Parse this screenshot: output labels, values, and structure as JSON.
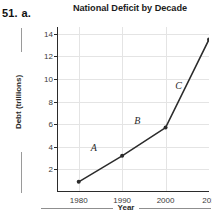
{
  "problem": {
    "number": "51.",
    "part": "a."
  },
  "chart_data": {
    "type": "line",
    "title": "National Deficit by Decade",
    "xlabel": "Year",
    "ylabel": "Debt (trillions)",
    "x": [
      1980,
      1990,
      2000,
      2010
    ],
    "values": [
      0.9,
      3.2,
      5.7,
      13.5
    ],
    "xtick_labels": [
      "1980",
      "1990",
      "2000",
      "201"
    ],
    "ytick_labels": [
      "2",
      "4",
      "6",
      "8",
      "10",
      "12",
      "14"
    ],
    "yticks": [
      2,
      4,
      6,
      8,
      10,
      12,
      14
    ],
    "xlim": [
      1975,
      2010
    ],
    "ylim": [
      0,
      14.6
    ],
    "grid": true,
    "legend": "none",
    "annotations": [
      {
        "label": "A",
        "x": 1983.5,
        "y": 4.0
      },
      {
        "label": "B",
        "x": 1993.5,
        "y": 6.4
      },
      {
        "label": "C",
        "x": 2003.0,
        "y": 9.5
      }
    ],
    "marker": "circle",
    "line_color": "#2b2b2b",
    "grid_color": "#e4e4e4"
  }
}
